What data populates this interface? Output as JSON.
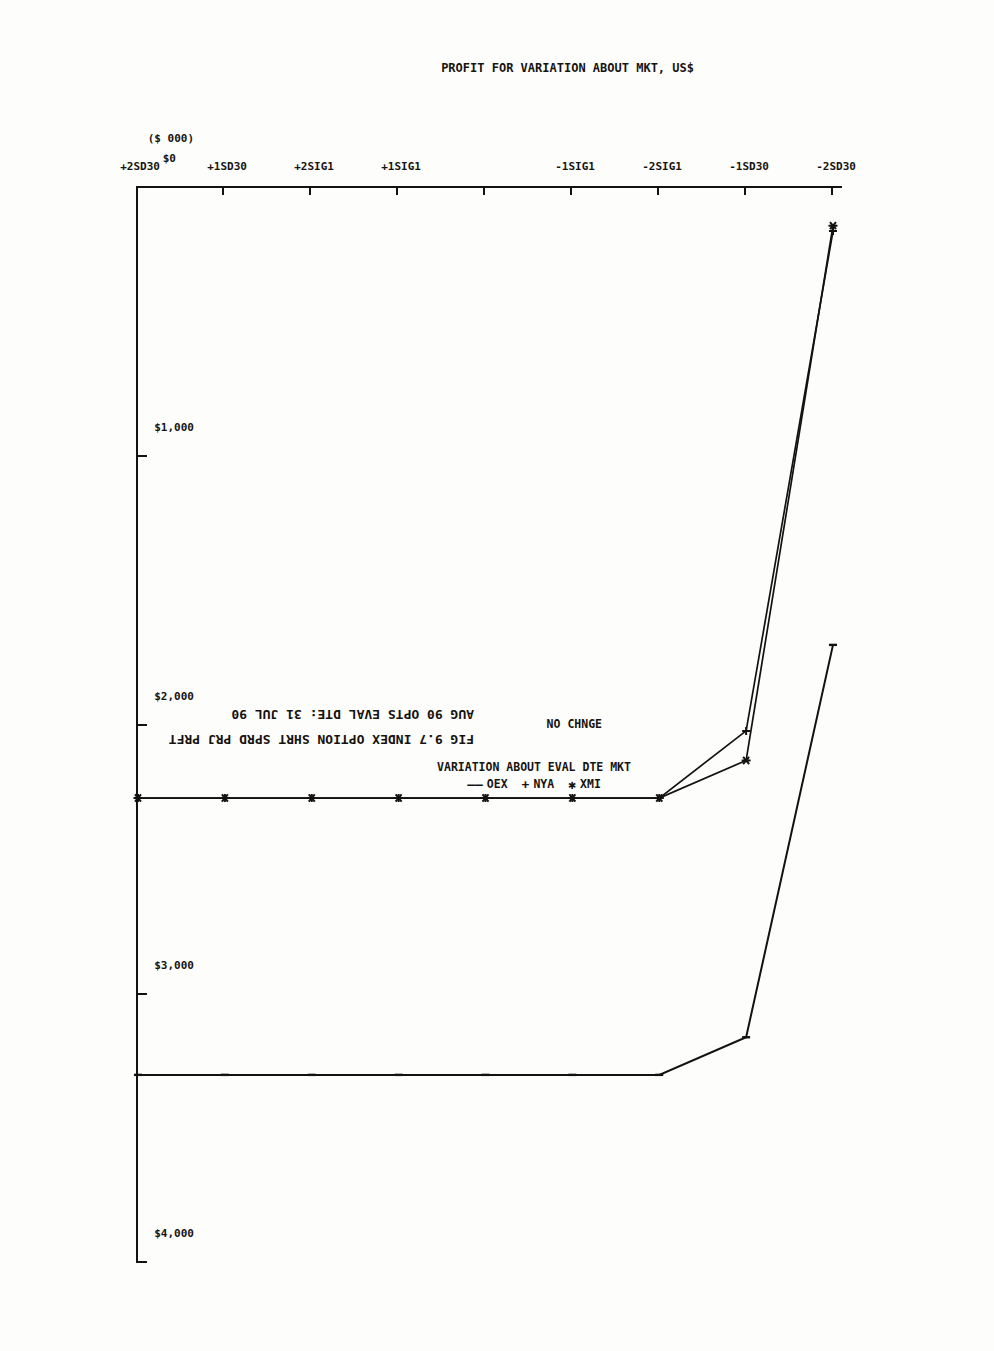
{
  "figure": {
    "title_line1": "FIG 9.7 INDEX OPTION SHRT SPRD PRJ PRFT",
    "title_line2": "AUG 90 OPTS EVAL DTE: 31 JUL 90",
    "no_change_marker": "NO CHNGE",
    "y_axis_unit": "($ 000)"
  },
  "legend": {
    "title": "VARIATION ABOUT EVAL DTE MKT",
    "items": [
      {
        "label": "OEX",
        "marker": "――",
        "color": "#171410"
      },
      {
        "label": "NYA",
        "marker": "+",
        "color": "#171410"
      },
      {
        "label": "XMI",
        "marker": "✱",
        "color": "#171410"
      }
    ]
  },
  "chart_data": {
    "type": "line",
    "title": "FIG 9.7 INDEX OPTION SHRT SPRD PRJ PRFT",
    "subtitle": "AUG 90 OPTS EVAL DTE: 31 JUL 90",
    "xlabel": "VARIATION ABOUT EVAL DTE MKT",
    "ylabel": "PROFIT FOR VARIATION ABOUT MKT, US$",
    "yunit": "($ 000)",
    "grid": false,
    "legend_position": "bottom",
    "categories": [
      "-2SD30",
      "-1SD30",
      "-2SIG1",
      "-1SIG1",
      "NO CHNGE",
      "+1SIG1",
      "+2SIG1",
      "+1SD30",
      "+2SD30"
    ],
    "xticklabels": [
      "-2SD30",
      "-1SD30",
      "-2SIG1",
      "-1SIG1",
      "NO CHNGE",
      "+1SIG1",
      "+2SIG1",
      "+1SD30",
      "+2SD30"
    ],
    "yticklabels": [
      "$0",
      "$1,000",
      "$2,000",
      "$3,000",
      "$4,000"
    ],
    "ytickvalues": [
      0,
      1000,
      2000,
      3000,
      4000
    ],
    "ylim": [
      -200,
      4400
    ],
    "series": [
      {
        "name": "OEX",
        "marker": "line",
        "values": [
          1700,
          3160,
          3300,
          3300,
          3300,
          3300,
          3300,
          3300,
          3300
        ]
      },
      {
        "name": "NYA",
        "marker": "plus",
        "values": [
          160,
          2020,
          2270,
          2270,
          2270,
          2270,
          2270,
          2270,
          2270
        ]
      },
      {
        "name": "XMI",
        "marker": "star",
        "values": [
          140,
          2130,
          2270,
          2270,
          2270,
          2270,
          2270,
          2270,
          2270
        ]
      }
    ],
    "zero_line": 0
  },
  "axes": {
    "y_title": "PROFIT FOR VARIATION ABOUT MKT, US$"
  }
}
